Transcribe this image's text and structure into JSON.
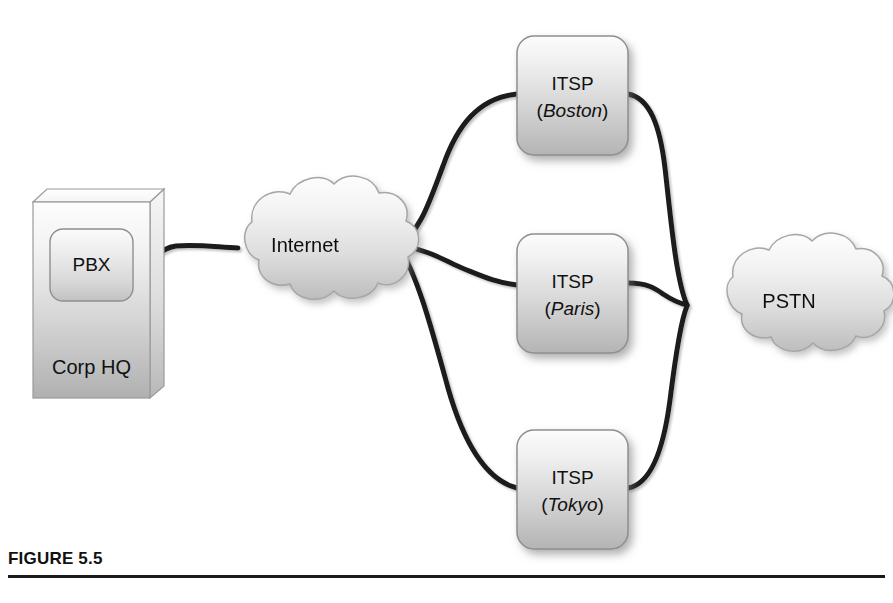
{
  "figure": {
    "caption": "FIGURE 5.5",
    "background_color": "#ffffff",
    "line_color": "#1a1a1a",
    "rule_color": "#1a1a1a"
  },
  "diagram": {
    "type": "network-topology",
    "nodes": [
      {
        "id": "corp-hq",
        "shape": "3d-box",
        "label": "Corp HQ",
        "x": 33,
        "y": 202,
        "width": 117,
        "height": 196
      },
      {
        "id": "pbx",
        "shape": "rounded-box",
        "label": "PBX",
        "x": 50,
        "y": 229,
        "width": 83,
        "height": 72
      },
      {
        "id": "internet",
        "shape": "cloud",
        "label": "Internet",
        "x": 215,
        "y": 196,
        "width": 185,
        "height": 112
      },
      {
        "id": "itsp-boston",
        "shape": "rounded-box",
        "label_line1": "ITSP",
        "label_city": "Boston",
        "x": 517,
        "y": 36,
        "width": 111,
        "height": 119
      },
      {
        "id": "itsp-paris",
        "shape": "rounded-box",
        "label_line1": "ITSP",
        "label_city": "Paris",
        "x": 517,
        "y": 234,
        "width": 111,
        "height": 119
      },
      {
        "id": "itsp-tokyo",
        "shape": "rounded-box",
        "label_line1": "ITSP",
        "label_city": "Tokyo",
        "x": 517,
        "y": 430,
        "width": 111,
        "height": 119
      },
      {
        "id": "pstn",
        "shape": "cloud",
        "label": "PSTN",
        "x": 700,
        "y": 252,
        "width": 180,
        "height": 107
      }
    ],
    "links": [
      {
        "id": "link-pbx-internet",
        "from": "pbx",
        "to": "internet"
      },
      {
        "id": "link-internet-boston",
        "from": "internet",
        "to": "itsp-boston"
      },
      {
        "id": "link-internet-paris",
        "from": "internet",
        "to": "itsp-paris"
      },
      {
        "id": "link-internet-tokyo",
        "from": "internet",
        "to": "itsp-tokyo"
      },
      {
        "id": "link-boston-pstn",
        "from": "itsp-boston",
        "to": "pstn"
      },
      {
        "id": "link-paris-pstn",
        "from": "itsp-paris",
        "to": "pstn"
      },
      {
        "id": "link-tokyo-pstn",
        "from": "itsp-tokyo",
        "to": "pstn"
      }
    ],
    "paren_open": "(",
    "paren_close": ")"
  }
}
